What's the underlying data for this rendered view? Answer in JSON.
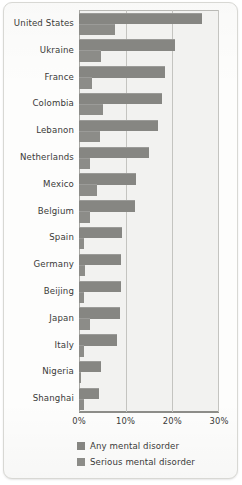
{
  "chart_data": {
    "type": "bar",
    "orientation": "horizontal",
    "title": "",
    "subtitle": "",
    "xlabel": "",
    "ylabel": "",
    "xlim": [
      0,
      30
    ],
    "xunit": "%",
    "grid": true,
    "legend_position": "bottom",
    "xticks": [
      {
        "value": 0,
        "label": "0%"
      },
      {
        "value": 10,
        "label": "10%"
      },
      {
        "value": 20,
        "label": "20%"
      },
      {
        "value": 30,
        "label": "30%"
      }
    ],
    "categories": [
      "United States",
      "Ukraine",
      "France",
      "Colombia",
      "Lebanon",
      "Netherlands",
      "Mexico",
      "Belgium",
      "Spain",
      "Germany",
      "Beijing",
      "Japan",
      "Italy",
      "Nigeria",
      "Shanghai"
    ],
    "series": [
      {
        "name": "Any mental disorder",
        "color": "#868682",
        "values": [
          26.4,
          20.5,
          18.4,
          17.8,
          16.9,
          14.9,
          12.2,
          12.0,
          9.2,
          9.1,
          9.1,
          8.8,
          8.2,
          4.7,
          4.3
        ]
      },
      {
        "name": "Serious mental disorder",
        "color": "#8c8c88",
        "values": [
          7.7,
          4.8,
          2.7,
          5.2,
          4.6,
          2.3,
          3.8,
          2.4,
          1.0,
          1.2,
          1.1,
          2.3,
          1.0,
          0.4,
          1.0
        ]
      }
    ]
  },
  "legend": {
    "items": [
      {
        "label": "Any mental disorder"
      },
      {
        "label": "Serious mental disorder"
      }
    ]
  }
}
